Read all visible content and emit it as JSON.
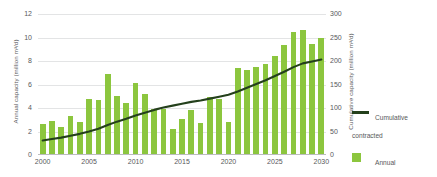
{
  "chart_data": {
    "type": "bar",
    "title": "",
    "subtitle": "",
    "xlabel": "",
    "ylabel": "Annual capacity (million m³/d)",
    "y2label": "Cumulative capacity (million m³/d)",
    "grid": true,
    "legend_position": "right",
    "ylim": [
      0,
      12
    ],
    "y2lim": [
      0,
      300
    ],
    "xlim": [
      2000,
      2030
    ],
    "y_ticks": [
      "0",
      "2",
      "4",
      "6",
      "8",
      "10",
      "12"
    ],
    "y_tick_values": [
      0,
      2,
      4,
      6,
      8,
      10,
      12
    ],
    "y2_ticks": [
      "0",
      "50",
      "100",
      "150",
      "200",
      "250",
      "300"
    ],
    "y2_tick_values": [
      0,
      50,
      100,
      150,
      200,
      250,
      300
    ],
    "x_ticks": [
      "2000",
      "2005",
      "2010",
      "2015",
      "2020",
      "2025",
      "2030"
    ],
    "x_tick_values": [
      2000,
      2005,
      2010,
      2015,
      2020,
      2025,
      2030
    ],
    "categories": [
      2000,
      2001,
      2002,
      2003,
      2004,
      2005,
      2006,
      2007,
      2008,
      2009,
      2010,
      2011,
      2012,
      2013,
      2014,
      2015,
      2016,
      2017,
      2018,
      2019,
      2020,
      2021,
      2022,
      2023,
      2024,
      2025,
      2026,
      2027,
      2028,
      2029,
      2030
    ],
    "series": [
      {
        "name": "Annual contracted",
        "type": "bar",
        "axis": "left",
        "color": "#8cc63e",
        "units": "million m³/d",
        "values": [
          2.6,
          2.9,
          2.35,
          3.35,
          2.8,
          4.75,
          4.7,
          6.9,
          5.05,
          4.45,
          6.15,
          5.2,
          3.95,
          3.95,
          2.2,
          3.1,
          3.85,
          2.7,
          4.95,
          4.8,
          2.85,
          7.4,
          7.25,
          7.5,
          7.75,
          8.45,
          9.35,
          10.45,
          10.65,
          9.45,
          9.95
        ]
      },
      {
        "name": "Cumulative contracted",
        "type": "line",
        "axis": "right",
        "color": "#24401c",
        "units": "million m³/d",
        "values": [
          31,
          34,
          37,
          41,
          45,
          50,
          56,
          64,
          71,
          77,
          84,
          90,
          96,
          101,
          105,
          109,
          113,
          116,
          120,
          124,
          128,
          135,
          143,
          151,
          159,
          168,
          177,
          187,
          195,
          199,
          203
        ]
      }
    ]
  },
  "legend": {
    "items": [
      {
        "label_line1": "Cumulative",
        "label_line2": "contracted",
        "swatch": "line-swatch",
        "color": "#24401c"
      },
      {
        "label_line1": "Annual",
        "label_line2": "contracted",
        "swatch": "box-swatch",
        "color": "#8cc63e"
      }
    ]
  }
}
